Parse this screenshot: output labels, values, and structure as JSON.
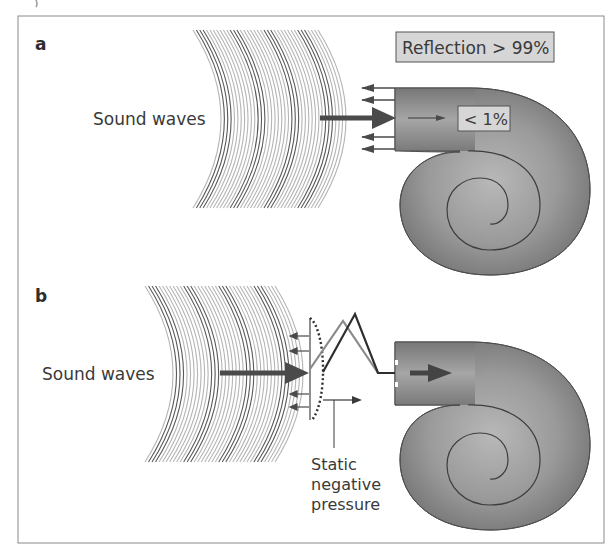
{
  "figure": {
    "frame": {
      "x": 18,
      "y": 16,
      "width": 586,
      "height": 527,
      "stroke": "#8a8a8a"
    },
    "colors": {
      "text": "#3a3a3a",
      "wave_dark": "#5a5a5a",
      "wave_light": "#b5b5b5",
      "arrow": "#4a4a4a",
      "cochlea_fill": "#8c8c8c",
      "cochlea_highlight": "#b4b4b4",
      "cochlea_stroke": "#4a4a4a",
      "label_box_fill": "#d6d6d6",
      "label_box_stroke": "#555555",
      "eardrum_gray": "#8f8f8f",
      "eardrum_dark": "#2e2e2e"
    }
  },
  "panels": [
    {
      "id": "a",
      "letter": "a",
      "sound_waves_label": "Sound waves",
      "reflection_label": "Reflection > 99%",
      "transmission_label": "< 1%"
    },
    {
      "id": "b",
      "letter": "b",
      "sound_waves_label": "Sound waves",
      "pressure_label_lines": [
        "Static",
        "negative",
        "pressure"
      ]
    }
  ]
}
